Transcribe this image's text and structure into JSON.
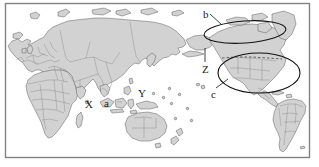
{
  "figure": {
    "kind": "annotated-world-map",
    "title": "",
    "projection": "pacific-centered-world-map",
    "width": 319,
    "height": 167,
    "colors": {
      "background": "#ffffff",
      "land_fill": "#d0d0d0",
      "land_stroke": "#4a4a4a",
      "country_border": "#6e6e6e",
      "ocean": "#ffffff",
      "frame": "#7a7a7a",
      "annotation": "#1a1a1a",
      "ellipse_stroke": "#1a1a1a",
      "dashed_border": "#3a3a3a"
    }
  },
  "frame": {
    "name": "map-border",
    "x": 5,
    "y": 3,
    "width": 305,
    "height": 155
  },
  "labels": [
    {
      "id": "label-b",
      "text": "b",
      "x": 203,
      "y": 9,
      "style": "lower"
    },
    {
      "id": "label-Z",
      "text": "Z",
      "x": 202,
      "y": 64,
      "style": "upper"
    },
    {
      "id": "label-c",
      "text": "c",
      "x": 211,
      "y": 89,
      "style": "lower"
    },
    {
      "id": "label-X",
      "text": "X",
      "x": 85,
      "y": 99,
      "style": "upper"
    },
    {
      "id": "label-a",
      "text": "a",
      "x": 104,
      "y": 98,
      "style": "lower"
    },
    {
      "id": "label-Y",
      "text": "Y",
      "x": 138,
      "y": 88,
      "style": "upper"
    }
  ],
  "ellipses": [
    {
      "id": "ellipse-b-region",
      "label_ref": "b",
      "cx": 245,
      "cy": 32,
      "rx": 41,
      "ry": 11,
      "rotate": -4,
      "describes": "northern-north-america-greenland"
    },
    {
      "id": "ellipse-c-region",
      "label_ref": "c",
      "cx": 259,
      "cy": 73,
      "rx": 41,
      "ry": 20,
      "rotate": 0,
      "describes": "contiguous-united-states"
    }
  ],
  "leader_lines": [
    {
      "id": "leader-b",
      "from_label": "b",
      "x1": 210,
      "y1": 14,
      "x2": 222,
      "y2": 25
    },
    {
      "id": "leader-Z",
      "from_label": "Z",
      "x1": 205,
      "y1": 62,
      "x2": 205,
      "y2": 48
    },
    {
      "id": "leader-c",
      "from_label": "c",
      "x1": 216,
      "y1": 88,
      "x2": 228,
      "y2": 79
    }
  ],
  "annotation_legend": {
    "letters": [
      "a",
      "b",
      "c",
      "X",
      "Y",
      "Z"
    ],
    "note": ""
  }
}
